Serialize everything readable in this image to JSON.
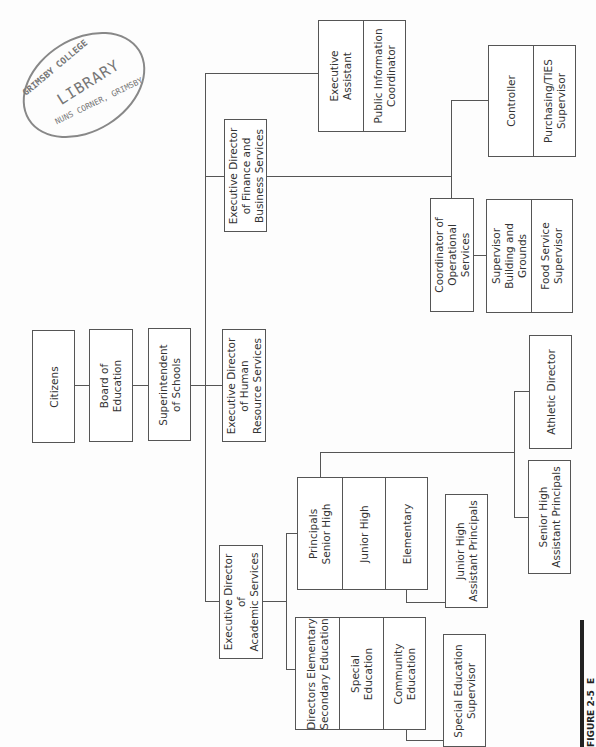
{
  "stamp": {
    "line1": "GRIMSBY COLLEGE",
    "line2": "LIBRARY",
    "line3": "NUNS CORNER, GRIMSBY"
  },
  "caption": {
    "text": "FIGURE 2-5  E"
  },
  "nodes": {
    "citizens": "Citizens",
    "board": "Board of\nEducation",
    "superintendent": "Superintendent\nof Schools",
    "exec_finance": "Executive Director\nof Finance and\nBusiness Services",
    "exec_assistant": "Executive\nAssistant",
    "public_info": "Public Information\nCoordinator",
    "controller": "Controller",
    "purchasing": "Purchasing/TIES\nSupervisor",
    "coordinator_ops": "Coordinator of\nOperational\nServices",
    "supervisor_bldg": "Supervisor\nBuilding and\nGrounds",
    "food_service": "Food Service\nSupervisor",
    "exec_hr": "Executive Director\nof Human\nResource Services",
    "exec_academic": "Executive Director\nof\nAcademic Services",
    "principals_sr": "Principals\nSenior High",
    "principals_jr": "Junior High",
    "principals_el": "Elementary",
    "jr_asst_principals": "Junior High\nAssistant Principals",
    "athletic_director": "Athletic Director",
    "sr_asst_principals": "Senior High\nAssistant Principals",
    "directors_el_sec": "Directors Elementary\nSecondary Education",
    "special_ed": "Special\nEducation",
    "community_ed": "Community\nEducation",
    "special_ed_supervisor": "Special Education\nSupervisor"
  }
}
